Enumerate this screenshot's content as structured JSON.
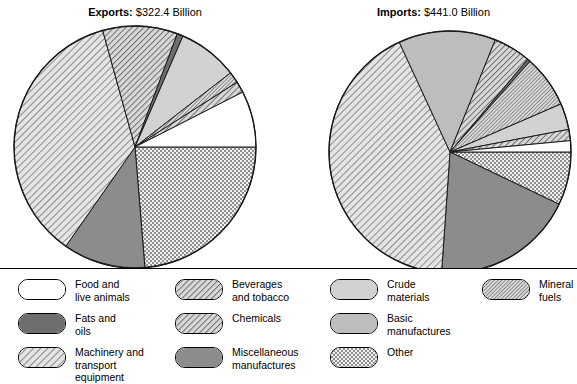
{
  "chart_data": {
    "type": "pie",
    "charts": [
      {
        "name": "exports",
        "title_label": "Exports:",
        "title_value": "$322.4 Billion",
        "total": 322.4,
        "unit": "Billion",
        "categories": [
          "Food and live animals",
          "Beverages and tobacco",
          "Crude materials",
          "Mineral fuels",
          "Fats and oils",
          "Chemicals",
          "Machinery and transport equipment",
          "Miscellaneous manufactures",
          "Other"
        ],
        "values": [
          7.5,
          1.5,
          8.0,
          1.5,
          0.8,
          10.0,
          36.0,
          11.0,
          23.7
        ],
        "slices": [
          {
            "label": "Other",
            "value": 23.7,
            "percent": 23.7,
            "pattern": "checker",
            "start_deg": 0,
            "end_deg": 85.3
          },
          {
            "label": "Miscellaneous manufactures",
            "value": 11.0,
            "percent": 11.0,
            "pattern": "solid-mid",
            "start_deg": 85.3,
            "end_deg": 124.9
          },
          {
            "label": "Machinery and transport equipment",
            "value": 36.0,
            "percent": 36.0,
            "pattern": "hatch-light",
            "start_deg": 124.9,
            "end_deg": 254.5
          },
          {
            "label": "Chemicals",
            "value": 10.0,
            "percent": 10.0,
            "pattern": "hatch-med",
            "start_deg": 254.5,
            "end_deg": 290.5
          },
          {
            "label": "Fats and oils",
            "value": 0.8,
            "percent": 0.8,
            "pattern": "solid-dark",
            "start_deg": 290.5,
            "end_deg": 293.4
          },
          {
            "label": "Crude materials",
            "value": 8.0,
            "percent": 8.0,
            "pattern": "gray-light",
            "start_deg": 293.4,
            "end_deg": 322.2
          },
          {
            "label": "Mineral fuels",
            "value": 1.5,
            "percent": 1.5,
            "pattern": "hatch-fine",
            "start_deg": 322.2,
            "end_deg": 327.6
          },
          {
            "label": "Beverages and tobacco",
            "value": 1.5,
            "percent": 1.5,
            "pattern": "hatch-med",
            "start_deg": 327.6,
            "end_deg": 333.0
          },
          {
            "label": "Food and live animals",
            "value": 7.5,
            "percent": 7.5,
            "pattern": "white",
            "start_deg": 333.0,
            "end_deg": 360.0
          }
        ]
      },
      {
        "name": "imports",
        "title_label": "Imports:",
        "title_value": "$441.0 Billion",
        "total": 441.0,
        "unit": "Billion",
        "categories": [
          "Food and live animals",
          "Beverages and tobacco",
          "Crude materials",
          "Mineral fuels",
          "Fats and oils",
          "Chemicals",
          "Machinery and transport equipment",
          "Miscellaneous manufactures",
          "Other"
        ],
        "values": [
          4.5,
          1.5,
          3.5,
          7.0,
          0.4,
          5.0,
          42.0,
          19.0,
          17.1
        ],
        "slices": [
          {
            "label": "Other",
            "value": 7.1,
            "percent": 7.1,
            "pattern": "checker",
            "start_deg": 0,
            "end_deg": 25.6
          },
          {
            "label": "Miscellaneous manufactures",
            "value": 19.0,
            "percent": 19.0,
            "pattern": "solid-mid",
            "start_deg": 25.6,
            "end_deg": 94.0
          },
          {
            "label": "Machinery and transport equipment",
            "value": 42.0,
            "percent": 42.0,
            "pattern": "hatch-light",
            "start_deg": 94.0,
            "end_deg": 245.2
          },
          {
            "label": "Basic manufactures",
            "value": 13.0,
            "percent": 13.0,
            "pattern": "gray-mid",
            "start_deg": 245.2,
            "end_deg": 292.0
          },
          {
            "label": "Chemicals",
            "value": 5.0,
            "percent": 5.0,
            "pattern": "hatch-med",
            "start_deg": 292.0,
            "end_deg": 310.0
          },
          {
            "label": "Fats and oils",
            "value": 0.4,
            "percent": 0.4,
            "pattern": "solid-dark",
            "start_deg": 310.0,
            "end_deg": 311.4
          },
          {
            "label": "Mineral fuels",
            "value": 7.0,
            "percent": 7.0,
            "pattern": "hatch-fine",
            "start_deg": 311.4,
            "end_deg": 336.6
          },
          {
            "label": "Crude materials",
            "value": 3.5,
            "percent": 3.5,
            "pattern": "gray-light",
            "start_deg": 336.6,
            "end_deg": 349.2
          },
          {
            "label": "Beverages and tobacco",
            "value": 1.5,
            "percent": 1.5,
            "pattern": "hatch-med",
            "start_deg": 349.2,
            "end_deg": 354.6
          },
          {
            "label": "Food and live animals",
            "value": 1.5,
            "percent": 1.5,
            "pattern": "white",
            "start_deg": 354.6,
            "end_deg": 360.0
          }
        ]
      }
    ],
    "legend_position": "bottom",
    "legend": [
      {
        "label": "Food and\nlive animals",
        "pattern": "white"
      },
      {
        "label": "Beverages\nand tobacco",
        "pattern": "hatch-med"
      },
      {
        "label": "Crude\nmaterials",
        "pattern": "gray-light"
      },
      {
        "label": "Mineral\nfuels",
        "pattern": "hatch-fine"
      },
      {
        "label": "Fats and\noils",
        "pattern": "solid-dark"
      },
      {
        "label": "Chemicals",
        "pattern": "hatch-med"
      },
      {
        "label": "Basic\nmanufactures",
        "pattern": "gray-mid"
      },
      {
        "label": "Machinery and\ntransport equipment",
        "pattern": "hatch-light"
      },
      {
        "label": "Miscellaneous\nmanufactures",
        "pattern": "solid-mid"
      },
      {
        "label": "Other",
        "pattern": "checker"
      }
    ],
    "colors": {
      "white": "#ffffff",
      "gray-light": "#d2d2d2",
      "gray-mid": "#bdbdbd",
      "solid-mid": "#8c8c8c",
      "solid-dark": "#6e6e6e",
      "hatch-light": "#e4e4e4",
      "hatch-med": "#d8d8d8",
      "hatch-fine": "#dcdcdc",
      "checker": "#cfcfcf",
      "outline": "#1a1a1a"
    }
  }
}
